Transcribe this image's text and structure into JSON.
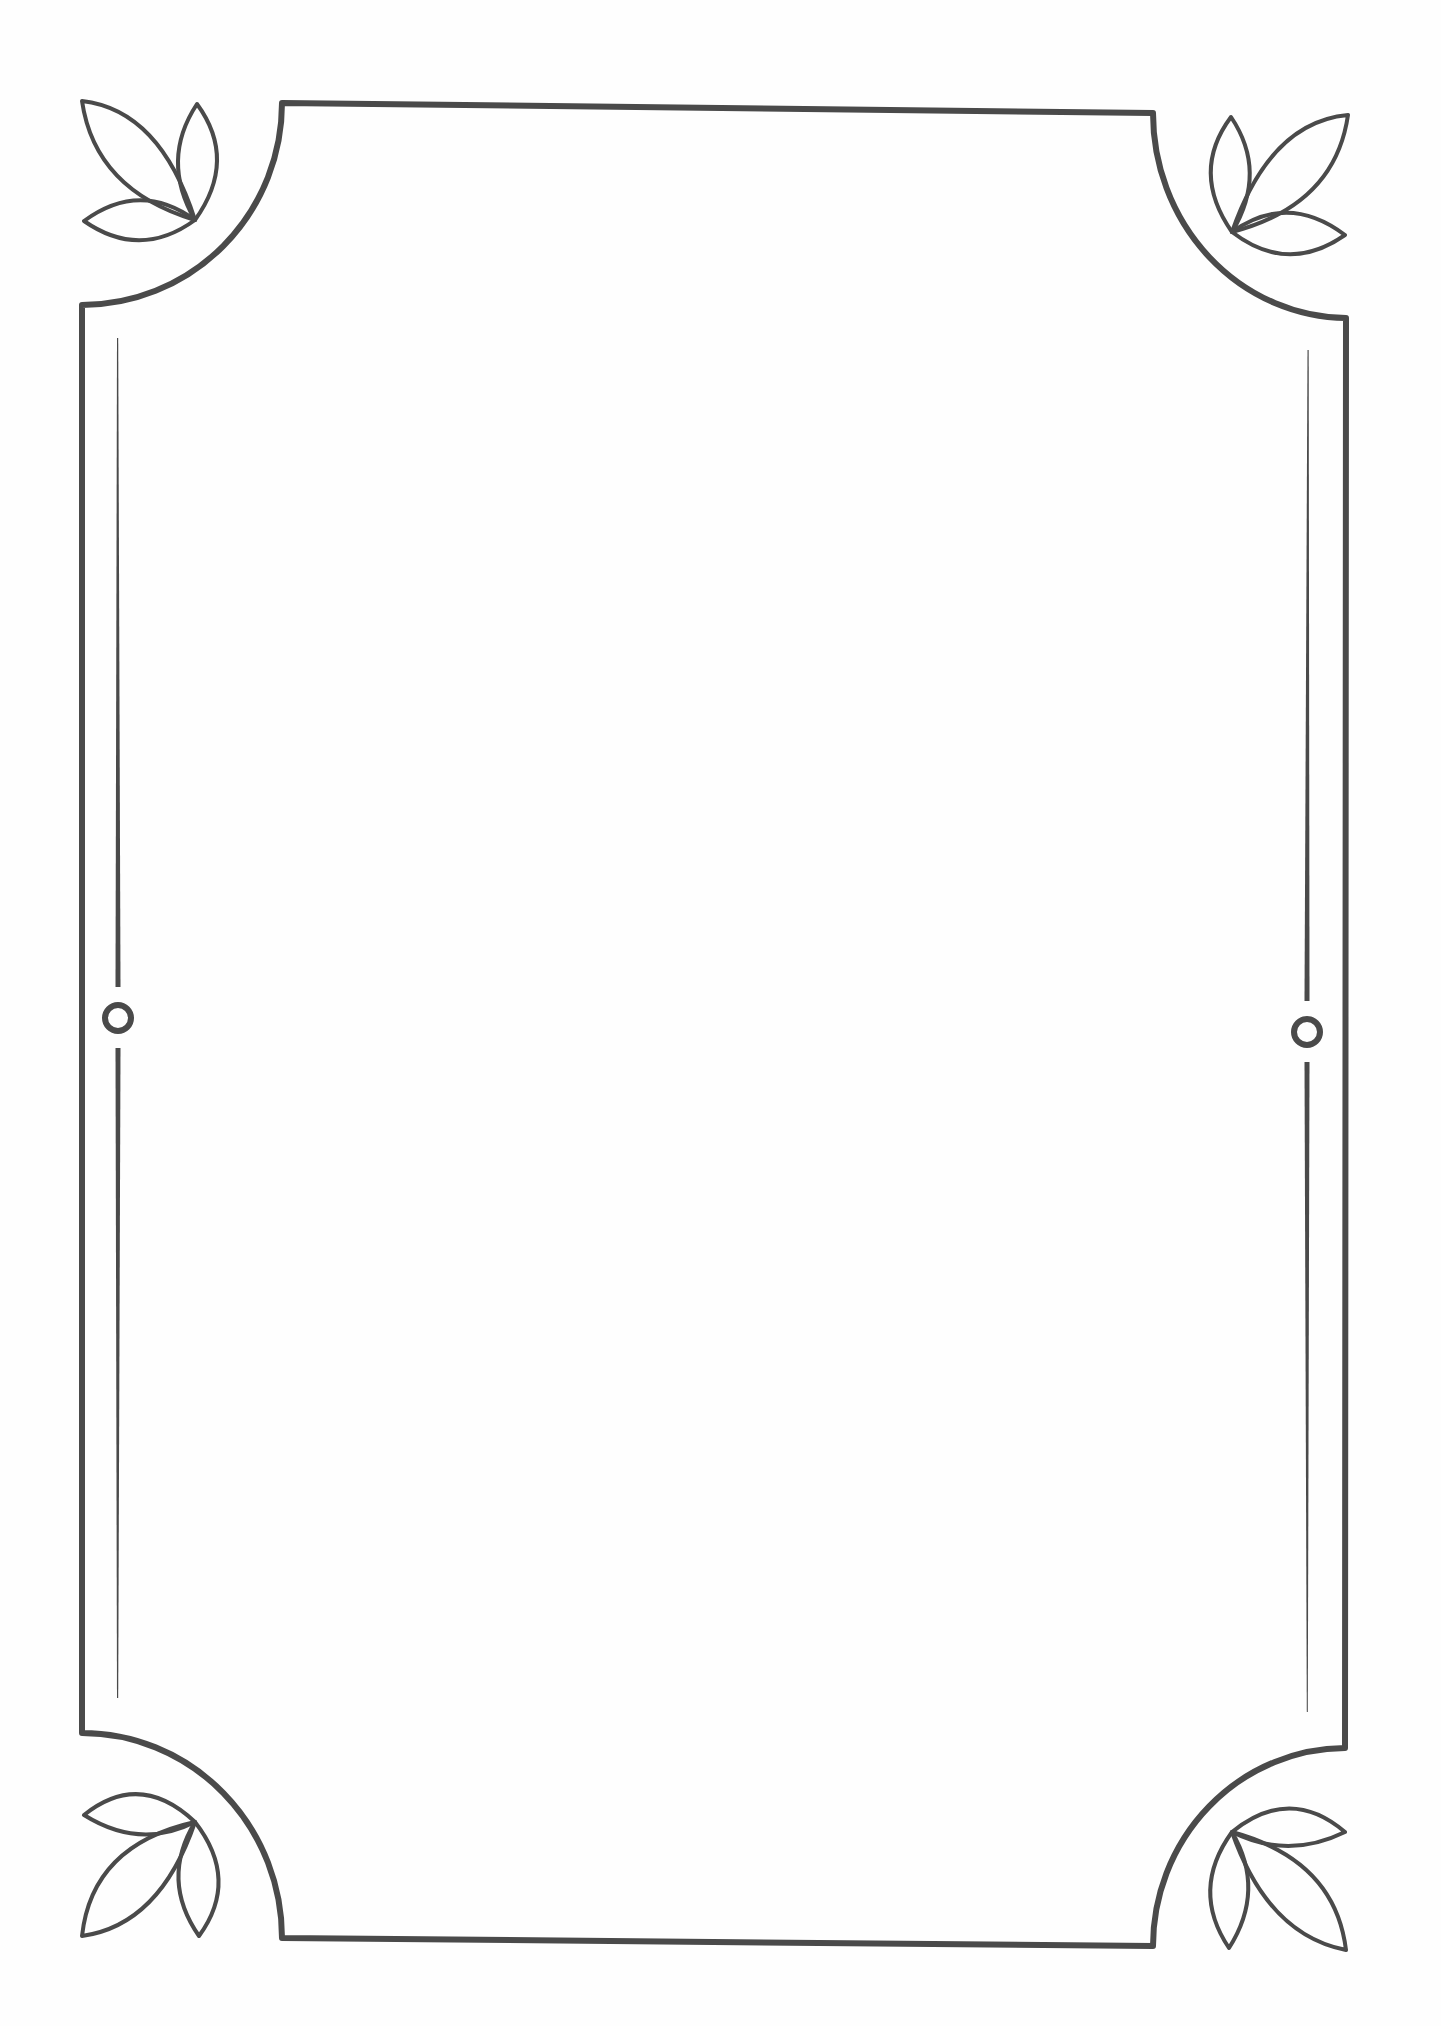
{
  "document": {
    "title": "Decorative border frame",
    "description": "Blank page with ornamental rectangular border, scalloped corners with three-leaf sprigs, and side medallion rings",
    "content_text": ""
  },
  "style": {
    "stroke_color": "#4a4a4a",
    "background": "#fefefe"
  },
  "ornaments": {
    "corners": [
      "top-left",
      "top-right",
      "bottom-left",
      "bottom-right"
    ],
    "corner_motif": "three-leaf-sprig",
    "side_motif": "ring"
  }
}
